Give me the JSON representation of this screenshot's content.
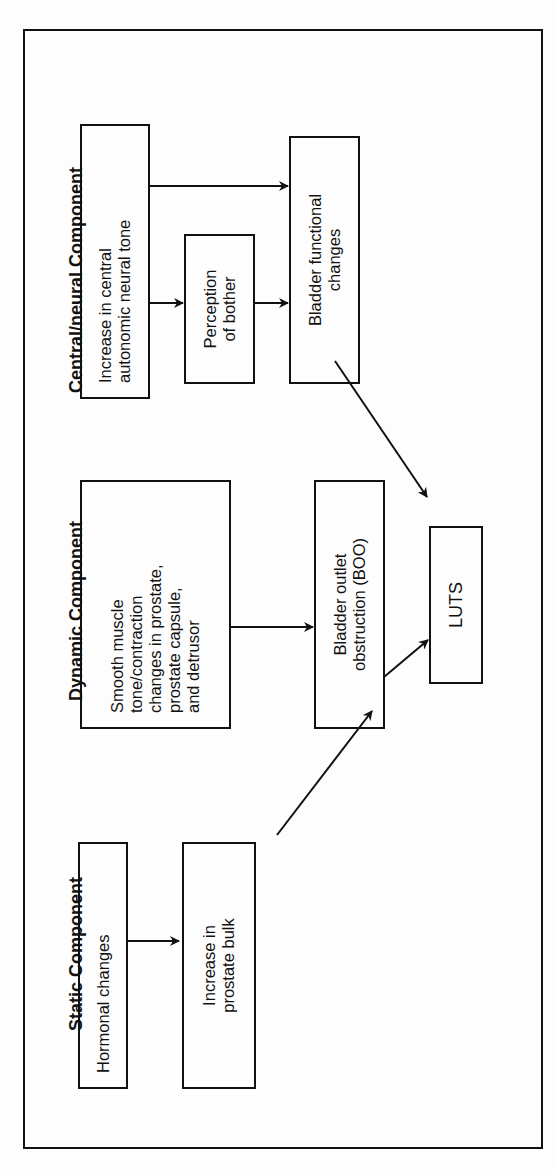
{
  "diagram": {
    "orientation": "rotated 90deg counter-clockwise",
    "columns": [
      {
        "label": "Static Component"
      },
      {
        "label": "Dynamic Component"
      },
      {
        "label": "Central/neural Component"
      }
    ],
    "nodes": {
      "hormonal": "Hormonal changes",
      "bulk": "Increase in\nprostate bulk",
      "smooth": "Smooth muscle\ntone/contraction\nchanges in prostate,\nprostate capsule,\nand detrusor",
      "boo": "Bladder outlet\nobstruction (BOO)",
      "luts": "LUTS",
      "central": "Increase in central\nautonomic neural tone",
      "bother": "Perception\nof bother",
      "bladder_fn": "Bladder functional\nchanges"
    },
    "edges": [
      {
        "from": "hormonal",
        "to": "bulk"
      },
      {
        "from": "bulk",
        "to": "boo"
      },
      {
        "from": "smooth",
        "to": "boo"
      },
      {
        "from": "boo",
        "to": "luts"
      },
      {
        "from": "central",
        "to": "bother"
      },
      {
        "from": "central",
        "to": "bladder_fn"
      },
      {
        "from": "bother",
        "to": "bladder_fn"
      },
      {
        "from": "bladder_fn",
        "to": "luts"
      }
    ],
    "colors": {
      "line": "#111111",
      "background": "#fdfdfd"
    }
  }
}
